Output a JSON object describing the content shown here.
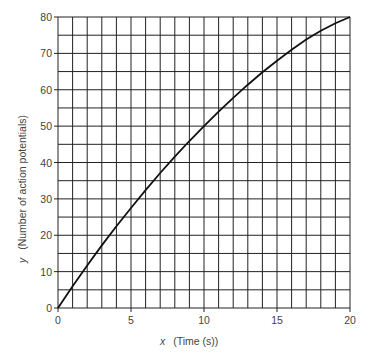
{
  "chart_data": {
    "type": "line",
    "title": "",
    "xlabel_var": "x",
    "xlabel": "(Time (s))",
    "ylabel_var": "y",
    "ylabel": "(Number of action potentials)",
    "xlim": [
      0,
      20
    ],
    "ylim": [
      0,
      80
    ],
    "xticks": [
      0,
      5,
      10,
      15,
      20
    ],
    "yticks": [
      0,
      10,
      20,
      30,
      40,
      50,
      60,
      70,
      80
    ],
    "grid": true,
    "grid_x_step": 1,
    "grid_y_step": 5,
    "series": [
      {
        "name": "action potentials",
        "color": "#111111",
        "x": [
          0,
          1,
          2,
          3,
          4,
          5,
          6,
          7,
          8,
          9,
          10,
          11,
          12,
          13,
          14,
          15,
          16,
          17,
          18,
          19,
          20
        ],
        "y": [
          0,
          6,
          11.7,
          17.2,
          22.5,
          27.5,
          32.4,
          37.1,
          41.6,
          45.9,
          50,
          54,
          57.8,
          61.4,
          64.8,
          68,
          71,
          73.8,
          76.2,
          78.3,
          80
        ]
      }
    ]
  }
}
